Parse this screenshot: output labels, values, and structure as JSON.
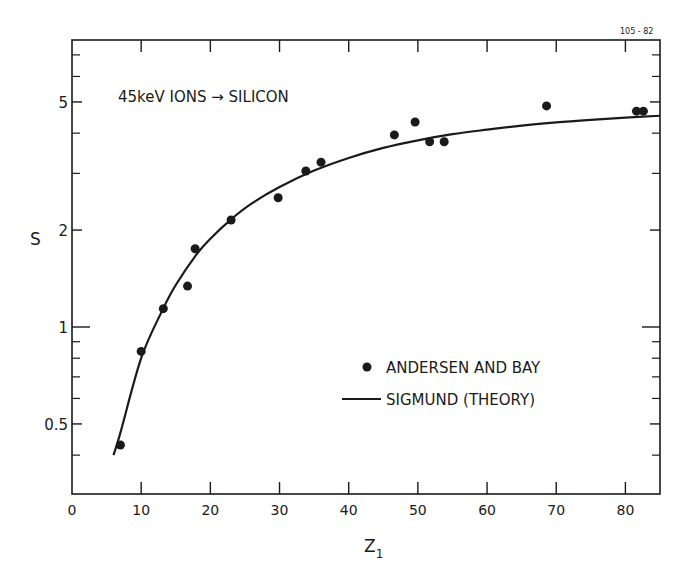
{
  "figure_id": "105 - 82",
  "annotation": "45keV IONS → SILICON",
  "legend": {
    "points_label": "ANDERSEN AND BAY",
    "line_label": "SIGMUND (THEORY)"
  },
  "chart_data": {
    "type": "scatter",
    "title": "45keV IONS → SILICON",
    "xlabel": "Z1",
    "ylabel": "S",
    "xlim": [
      0,
      85
    ],
    "ylim": [
      0.3,
      8
    ],
    "yscale": "log",
    "grid": false,
    "legend_position": "lower right (inside)",
    "x_ticks": [
      0,
      10,
      20,
      30,
      40,
      50,
      60,
      70,
      80
    ],
    "y_tick_labels": [
      "0.5",
      "1",
      "2",
      "5"
    ],
    "y_tick_values": [
      0.5,
      1,
      2,
      5
    ],
    "y_minor_ticks": [
      0.4,
      0.6,
      0.7,
      0.8,
      0.9,
      3,
      4,
      6,
      7
    ],
    "series": [
      {
        "name": "ANDERSEN AND BAY",
        "type": "scatter",
        "x": [
          7,
          10,
          13.2,
          16.7,
          17.8,
          23,
          29.8,
          33.8,
          36,
          46.6,
          49.6,
          51.7,
          53.8,
          68.6,
          81.6,
          82.6
        ],
        "y": [
          0.43,
          0.84,
          1.14,
          1.34,
          1.75,
          2.15,
          2.52,
          3.05,
          3.25,
          3.95,
          4.33,
          3.76,
          3.76,
          4.86,
          4.68,
          4.68
        ]
      },
      {
        "name": "SIGMUND (THEORY)",
        "type": "line",
        "x": [
          6,
          7,
          10,
          13,
          15,
          18,
          20,
          23,
          26,
          30,
          35,
          40,
          45,
          50,
          55,
          60,
          65,
          70,
          75,
          80,
          85
        ],
        "y": [
          0.4,
          0.47,
          0.8,
          1.12,
          1.35,
          1.68,
          1.88,
          2.16,
          2.42,
          2.72,
          3.06,
          3.35,
          3.6,
          3.8,
          3.97,
          4.1,
          4.22,
          4.32,
          4.4,
          4.47,
          4.53
        ]
      }
    ]
  }
}
